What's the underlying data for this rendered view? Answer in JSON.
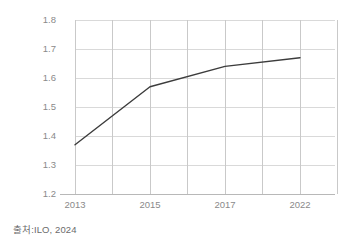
{
  "chart_data": {
    "type": "line",
    "title": "",
    "subtitle": "",
    "xlabel": "",
    "ylabel": "",
    "categories": [
      "2013",
      "2015",
      "2017",
      "2022"
    ],
    "x": [
      2013,
      2015,
      2017,
      2022
    ],
    "values": [
      1.37,
      1.57,
      1.64,
      1.67
    ],
    "series": [
      {
        "name": "",
        "values": [
          1.37,
          1.57,
          1.64,
          1.67
        ],
        "color": "#3c3c3c"
      }
    ],
    "ylim": [
      1.2,
      1.8
    ],
    "y_ticks": [
      "1.2",
      "1.3",
      "1.4",
      "1.5",
      "1.6",
      "1.7",
      "1.8"
    ],
    "y_tick_values": [
      1.2,
      1.3,
      1.4,
      1.5,
      1.6,
      1.7,
      1.8
    ],
    "x_ticks": [
      "2013",
      "2015",
      "2017",
      "2022"
    ],
    "grid": "both",
    "legend": "none",
    "annotations": []
  },
  "source": {
    "text": "출처:ILO, 2024"
  },
  "colors": {
    "line": "#3c3c3c",
    "grid": "#d4d4d4",
    "grid_minor": "#e2e2e2",
    "tick_text": "#8a8a8a",
    "source_text": "#6b6b6b",
    "background": "#ffffff"
  },
  "geometry": {
    "plot_left": 75,
    "plot_right": 335,
    "plot_top": 20,
    "plot_bottom": 194,
    "x_gridlines": [
      75,
      112,
      150,
      187,
      225,
      262,
      300,
      337
    ],
    "data_x": [
      75,
      150,
      225,
      300
    ],
    "y_gridlines": [
      20,
      49,
      78,
      107,
      136,
      165,
      194
    ]
  }
}
